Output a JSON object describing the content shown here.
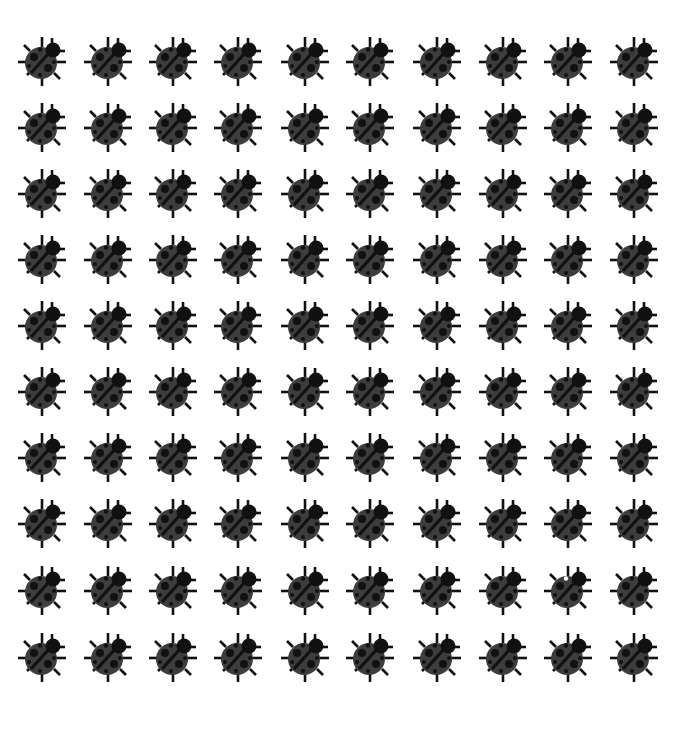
{
  "grid": {
    "rows": 10,
    "cols": 10,
    "col_centers": [
      42,
      108,
      173,
      238,
      305,
      370,
      437,
      503,
      568,
      634
    ],
    "row_centers": [
      61,
      127,
      193,
      259,
      325,
      391,
      457,
      523,
      590,
      657
    ],
    "icon": "ladybug-icon",
    "odd_one_out": {
      "row": 9,
      "col": 9,
      "feature": "white spot near head"
    }
  },
  "colors": {
    "background": "#ffffff",
    "body": "#3d3d3d",
    "dark": "#111111",
    "odd_spot": "#ffffff"
  }
}
